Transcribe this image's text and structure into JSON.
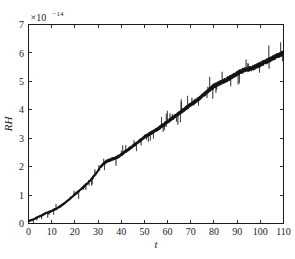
{
  "figure": {
    "width": 295,
    "height": 259,
    "background": "#ffffff",
    "data_color": "#121212",
    "axis_color": "#1a1a1a"
  },
  "chart_data": {
    "type": "line",
    "title": "",
    "subtitle": "",
    "xlabel": "t",
    "ylabel": "RH",
    "y_exponent_label": "×10",
    "y_exponent_power": "−14",
    "y_exponent_full": "×10⁻¹⁴",
    "xlim": [
      0,
      110
    ],
    "ylim": [
      0,
      7
    ],
    "xticks": [
      0,
      10,
      20,
      30,
      40,
      50,
      60,
      70,
      80,
      90,
      100,
      110
    ],
    "xtick_labels": [
      "0",
      "10",
      "20",
      "30",
      "40",
      "50",
      "60",
      "70",
      "80",
      "90",
      "100",
      "110"
    ],
    "yticks": [
      0,
      1,
      2,
      3,
      4,
      5,
      6,
      7
    ],
    "ytick_labels": [
      "0",
      "1",
      "2",
      "3",
      "4",
      "5",
      "6",
      "7"
    ],
    "grid": false,
    "legend": null,
    "tick_direction": "in",
    "annotations": [],
    "series": [
      {
        "name": "RH",
        "style": "noisy-band",
        "color": "#121212",
        "noise_amplitude": 0.07,
        "spike_amplitude": 0.3,
        "x": [
          0,
          2,
          4,
          6,
          8,
          10,
          12,
          14,
          16,
          18,
          20,
          22,
          24,
          26,
          28,
          30,
          32,
          34,
          36,
          38,
          40,
          42,
          44,
          46,
          48,
          50,
          52,
          54,
          56,
          58,
          60,
          62,
          64,
          66,
          68,
          70,
          72,
          74,
          76,
          78,
          80,
          82,
          84,
          86,
          88,
          90,
          92,
          94,
          96,
          98,
          100,
          102,
          104,
          106,
          108,
          110
        ],
        "values": [
          0.08,
          0.14,
          0.22,
          0.3,
          0.38,
          0.44,
          0.52,
          0.62,
          0.74,
          0.88,
          1.02,
          1.16,
          1.3,
          1.46,
          1.64,
          1.86,
          2.08,
          2.2,
          2.26,
          2.32,
          2.42,
          2.54,
          2.66,
          2.78,
          2.92,
          3.04,
          3.14,
          3.24,
          3.34,
          3.46,
          3.58,
          3.7,
          3.82,
          3.94,
          4.06,
          4.18,
          4.3,
          4.42,
          4.56,
          4.7,
          4.84,
          4.92,
          5.0,
          5.08,
          5.18,
          5.28,
          5.36,
          5.42,
          5.44,
          5.52,
          5.6,
          5.68,
          5.76,
          5.84,
          5.92,
          6.0
        ]
      }
    ]
  }
}
